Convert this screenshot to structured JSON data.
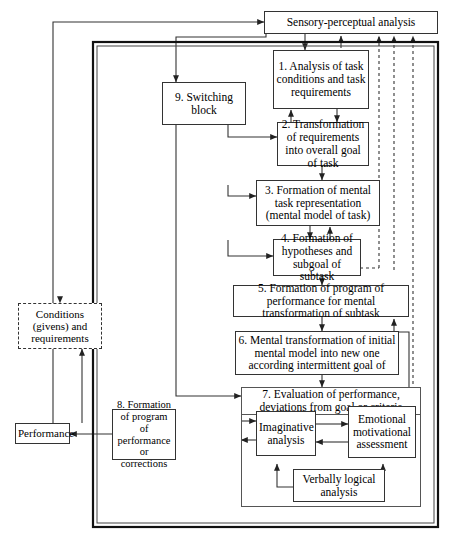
{
  "figure": {
    "type": "flow-diagram"
  },
  "outer_frame": {
    "name": "main-system-boundary",
    "style": "double-line"
  },
  "nodes": {
    "sensory": {
      "id": "sensory",
      "label": "Sensory-perceptual analysis"
    },
    "switching": {
      "id": "switching",
      "label": "9. Switching block"
    },
    "box1": {
      "id": "box1",
      "label": "1. Analysis of task conditions and task requirements"
    },
    "box2": {
      "id": "box2",
      "label": "2. Transformation of requirements into overall goal of task"
    },
    "box3": {
      "id": "box3",
      "label": "3. Formation of mental task representation (mental model of task)"
    },
    "box4": {
      "id": "box4",
      "label": "4. Formation of hypotheses and subgoal of subtask"
    },
    "box5": {
      "id": "box5",
      "label": "5. Formation of program of performance for mental transformation of subtask"
    },
    "box6": {
      "id": "box6",
      "label": "6. Mental transformation of initial mental model into new one according intermittent goal of"
    },
    "box7": {
      "id": "box7",
      "label": "7. Evaluation of performance, deviations from goal or criteria"
    },
    "box8": {
      "id": "box8",
      "label": "8. Formation of program of performance or corrections"
    },
    "conditions": {
      "id": "conditions",
      "label": "Conditions (givens) and requirements"
    },
    "performance": {
      "id": "performance",
      "label": "Performance"
    },
    "imaginative": {
      "id": "imaginative",
      "label": "Imaginative analysis"
    },
    "emotional": {
      "id": "emotional",
      "label": "Emotional motivational assessment"
    },
    "verbal": {
      "id": "verbal",
      "label": "Verbally logical analysis"
    }
  },
  "colors": {
    "line": "#333333",
    "frame": "#111111",
    "background": "#ffffff",
    "text": "#000000"
  }
}
